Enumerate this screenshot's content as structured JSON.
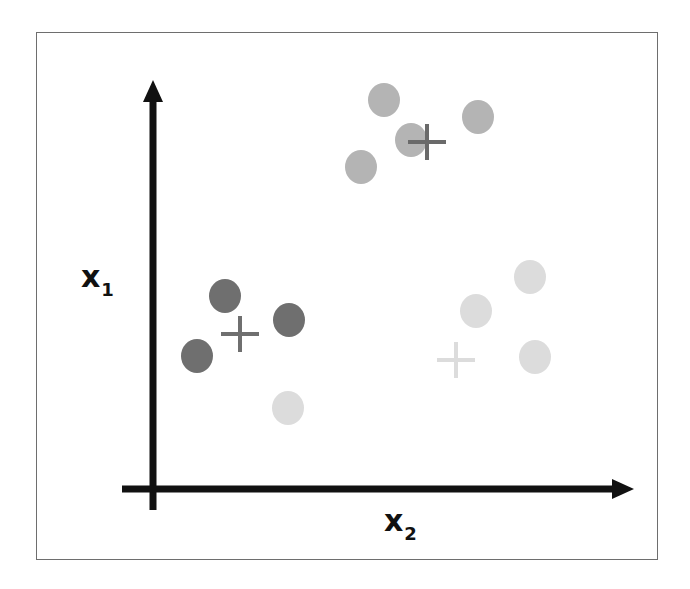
{
  "chart_data": {
    "type": "scatter",
    "title": "",
    "xlabel": "x2",
    "ylabel": "x1",
    "axes": {
      "grid": false,
      "ticks": false,
      "legend": false
    },
    "labels": {
      "y_main": "x",
      "y_sub": "1",
      "x_main": "x",
      "x_sub": "2"
    },
    "clusters": [
      {
        "name": "cluster-upper",
        "color": "#b4b4b4",
        "centroid_color": "#6a6a6a",
        "points_px": [
          [
            384,
            100
          ],
          [
            411,
            140
          ],
          [
            361,
            167
          ],
          [
            478,
            117
          ]
        ],
        "centroid_px": [
          427,
          142
        ]
      },
      {
        "name": "cluster-dark",
        "color": "#6f6f6f",
        "centroid_color": "#6f6f6f",
        "points_px": [
          [
            225,
            296
          ],
          [
            289,
            320
          ],
          [
            197,
            356
          ]
        ],
        "centroid_px": [
          240,
          334
        ]
      },
      {
        "name": "cluster-light",
        "color": "#dcdcdc",
        "centroid_color": "#dcdcdc",
        "points_px": [
          [
            530,
            277
          ],
          [
            476,
            311
          ],
          [
            535,
            357
          ],
          [
            288,
            408
          ]
        ],
        "centroid_px": [
          456,
          360
        ]
      }
    ]
  }
}
